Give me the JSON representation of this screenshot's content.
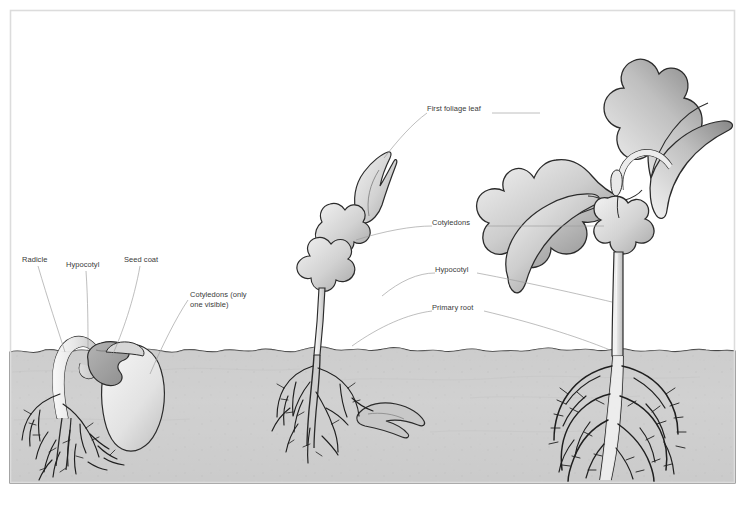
{
  "figure": {
    "frame_color": "#d8d8d8",
    "soil_color": "#cfcfcf",
    "soil_dark_color": "#bfbfbf",
    "leaf_fill_light": "#e3e3e3",
    "leaf_fill_dark": "#949494",
    "outline_color": "#2b2b2b",
    "leader_color": "#9a9a9a",
    "label_color": "#3a3a3a",
    "background": "#ffffff"
  },
  "top_caption": {
    "text": ""
  },
  "labels": [
    {
      "id": "radicle",
      "text": "Radicle",
      "x": 22,
      "y": 259
    },
    {
      "id": "hypocotyl_left",
      "text": "Hypocotyl",
      "x": 66,
      "y": 264
    },
    {
      "id": "seed_coat",
      "text": "Seed coat",
      "x": 124,
      "y": 259
    },
    {
      "id": "cotyledons_only",
      "text": "Cotyledons (only\none visible)",
      "x": 190,
      "y": 294
    },
    {
      "id": "first_foliage",
      "text": "First foliage leaf",
      "x": 427,
      "y": 108
    },
    {
      "id": "cotyledons",
      "text": "Cotyledons",
      "x": 432,
      "y": 222
    },
    {
      "id": "hypocotyl_right",
      "text": "Hypocotyl",
      "x": 435,
      "y": 269
    },
    {
      "id": "primary_root",
      "text": "Primary root",
      "x": 432,
      "y": 307
    }
  ],
  "stages": [
    {
      "id": "stage-1-germinating-seed",
      "name": "Germinating seed",
      "x_center": 95
    },
    {
      "id": "stage-2-young-seedling",
      "name": "Young seedling",
      "x_center": 345
    },
    {
      "id": "stage-3-established-seedling",
      "name": "Established seedling",
      "x_center": 620
    }
  ],
  "soil": {
    "surface_y": 352,
    "bottom_y": 483
  }
}
